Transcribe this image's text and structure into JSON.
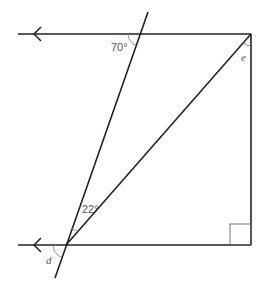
{
  "diagram": {
    "colors": {
      "line": "#222222",
      "arc": "#777777",
      "label": "#555555"
    },
    "labels": {
      "angle_top": "70°",
      "angle_middle": "22°",
      "angle_e": "e",
      "angle_d": "d"
    },
    "shapes": {
      "top_parallel_line": {
        "x1": 18,
        "y1": 34,
        "x2": 251,
        "y2": 34,
        "arrow": "left"
      },
      "bottom_parallel_line": {
        "x1": 18,
        "y1": 245,
        "x2": 251,
        "y2": 245,
        "arrow": "left"
      },
      "right_vertical_line": {
        "x1": 251,
        "y1": 34,
        "x2": 251,
        "y2": 245
      },
      "transversal": {
        "x1": 148,
        "y1": 12,
        "x2": 55,
        "y2": 278
      },
      "diagonal": {
        "x1": 66,
        "y1": 245,
        "x2": 251,
        "y2": 34
      },
      "right_angle_marker": {
        "x": 230,
        "y": 224,
        "size": 21
      }
    }
  }
}
